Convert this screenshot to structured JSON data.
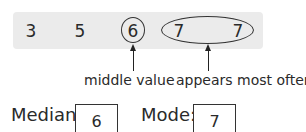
{
  "data_set": {
    "values": [
      "3",
      "5",
      "6",
      "7",
      "7"
    ],
    "highlight_median_index": 2,
    "highlight_mode_indices": [
      3,
      4
    ]
  },
  "annotations": {
    "median_label": "middle value",
    "mode_label": "appears most often"
  },
  "results": {
    "median_label": "Median:",
    "median_value": "6",
    "mode_label": "Mode:",
    "mode_value": "7"
  }
}
